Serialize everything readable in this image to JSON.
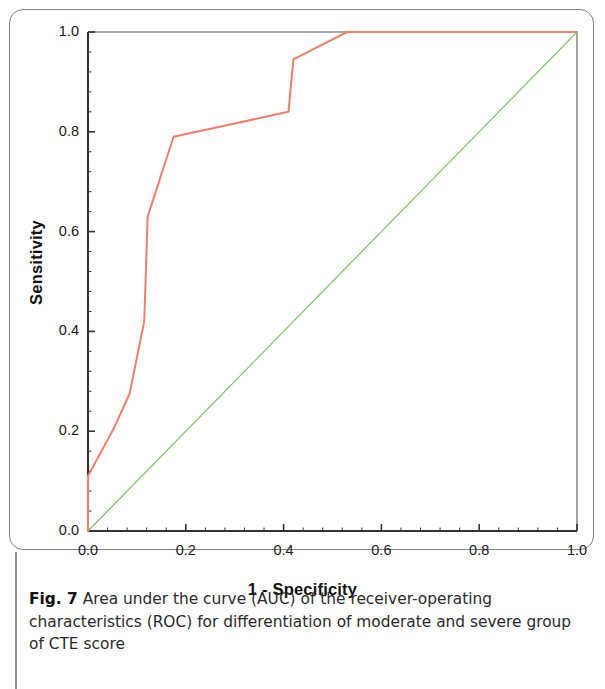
{
  "figure": {
    "caption_label": "Fig. 7",
    "caption_text": "Area under the curve (AUC) of the receiver-operating characteristics (ROC) for differentiation of moderate and severe group of CTE score"
  },
  "colors": {
    "roc_curve": "#ef7f6e",
    "reference_line": "#86c46a",
    "axis": "#3a3336",
    "frame": "#7d8184",
    "text": "#1a1a1a"
  },
  "chart_data": {
    "type": "line",
    "title": "",
    "subtitle": "",
    "xlabel": "1 - Specificity",
    "ylabel": "Sensitivity",
    "xlim": [
      0.0,
      1.0
    ],
    "ylim": [
      0.0,
      1.0
    ],
    "xticks": [
      "0.0",
      "0.2",
      "0.4",
      "0.6",
      "0.8",
      "1.0"
    ],
    "xtick_values": [
      0.0,
      0.2,
      0.4,
      0.6,
      0.8,
      1.0
    ],
    "yticks": [
      "0.0",
      "0.2",
      "0.4",
      "0.6",
      "0.8",
      "1.0"
    ],
    "ytick_values": [
      0.0,
      0.2,
      0.4,
      0.6,
      0.8,
      1.0
    ],
    "minor_ticks_per_interval": 4,
    "grid": false,
    "legend": "none",
    "series": [
      {
        "name": "ROC curve",
        "color": "#ef7f6e",
        "x": [
          0.0,
          0.0,
          0.055,
          0.085,
          0.115,
          0.122,
          0.175,
          0.41,
          0.42,
          0.53,
          1.0
        ],
        "y": [
          0.0,
          0.11,
          0.21,
          0.275,
          0.42,
          0.63,
          0.79,
          0.84,
          0.945,
          1.0,
          1.0
        ]
      },
      {
        "name": "Reference line",
        "color": "#86c46a",
        "x": [
          0.0,
          1.0
        ],
        "y": [
          0.0,
          1.0
        ]
      }
    ]
  }
}
